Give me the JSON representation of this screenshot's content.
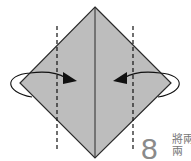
{
  "diagram": {
    "shape": "diamond",
    "fill": "#bdbdbd",
    "stroke": "#2a2a2a",
    "fold_lines": [
      "left-dashed-valley",
      "right-dashed-valley"
    ],
    "arrows": [
      "fold-left-flap-to-center",
      "fold-right-flap-to-center"
    ],
    "step_number": "8",
    "instruction_text": "將兩\n兩"
  }
}
